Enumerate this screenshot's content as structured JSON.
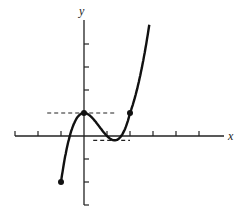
{
  "chart_data": {
    "type": "line",
    "title": "",
    "xlabel": "x",
    "ylabel": "y",
    "function": "y = x^3 - 2x^2 + 1",
    "x_ticks": [
      -3,
      -2,
      -1,
      1,
      2,
      3,
      4,
      5
    ],
    "y_ticks": [
      -3,
      -2,
      -1,
      1,
      2,
      3,
      4
    ],
    "xlim": [
      -3,
      5
    ],
    "ylim": [
      -3,
      5
    ],
    "grid": false,
    "legend": null,
    "marked_points": [
      {
        "x": -1,
        "y": -2,
        "label": "endpoint"
      },
      {
        "x": 0,
        "y": 1,
        "label": "local maximum"
      },
      {
        "x": 2,
        "y": 1,
        "label": "point"
      }
    ],
    "horizontal_tangents": [
      {
        "y": 1,
        "x_from": -1.6,
        "x_to": 1.4,
        "style": "dashed"
      },
      {
        "y": -0.19,
        "x_from": 0.4,
        "x_to": 2.0,
        "style": "dashed"
      }
    ],
    "series": [
      {
        "name": "f(x)",
        "x": [
          -1,
          -0.5,
          0,
          0.5,
          1,
          1.333,
          1.5,
          2,
          2.5,
          2.6
        ],
        "values": [
          -2,
          0.375,
          1,
          0.625,
          0,
          -0.185,
          -0.125,
          1,
          4.125,
          5.06
        ]
      }
    ]
  },
  "labels": {
    "x_axis": "x",
    "y_axis": "y"
  }
}
